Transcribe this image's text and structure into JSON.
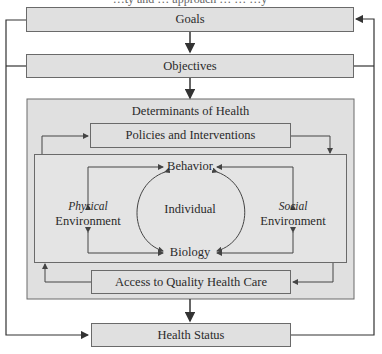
{
  "diagram": {
    "top_fragment": "…ty and … approach … … …y",
    "boxes": {
      "goals": "Goals",
      "objectives": "Objectives",
      "determinants": "Determinants of Health",
      "policies": "Policies and Interventions",
      "access": "Access to Quality Health Care",
      "health_status": "Health Status"
    },
    "inner": {
      "behavior": "Behavior",
      "biology": "Biology",
      "individual": "Individual",
      "physical_italic": "Physical",
      "physical_env": "Environment",
      "social_italic": "Social",
      "social_env": "Environment"
    },
    "colors": {
      "box_fill": "#e0e0e0",
      "line": "#3a3a3a"
    }
  }
}
